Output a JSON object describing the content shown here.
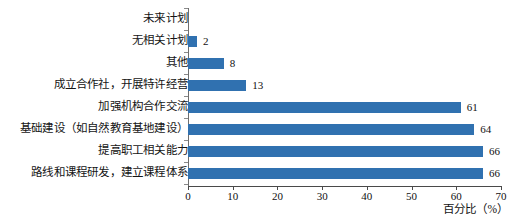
{
  "chart_data": {
    "type": "bar",
    "orientation": "horizontal",
    "title": "",
    "xlabel": "百分比（%）",
    "ylabel": "",
    "xlim": [
      0,
      70
    ],
    "xticks": [
      0,
      10,
      20,
      30,
      40,
      50,
      60,
      70
    ],
    "grid": false,
    "legend": false,
    "bar_color": "#3071b0",
    "categories": [
      "未来计划",
      "无相关计划",
      "其他",
      "成立合作社，开展特许经营",
      "加强机构合作交流",
      "基础建设（如自然教育基地建设）",
      "提高职工相关能力",
      "路线和课程研发，建立课程体系"
    ],
    "values": [
      null,
      2,
      8,
      13,
      61,
      64,
      66,
      66
    ],
    "value_labels": [
      "",
      "2",
      "8",
      "13",
      "61",
      "64",
      "66",
      "66"
    ]
  }
}
